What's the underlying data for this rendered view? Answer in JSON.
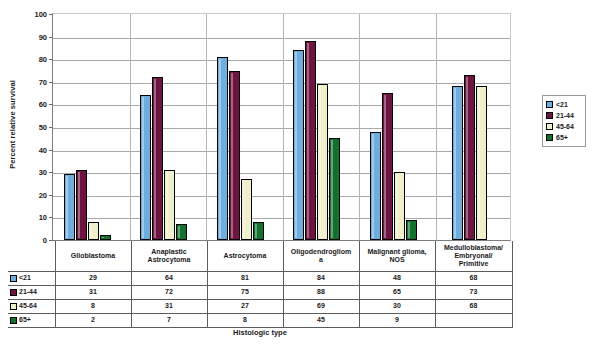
{
  "chart_data": {
    "type": "bar",
    "title": "",
    "xlabel": "Histologic type",
    "ylabel": "Percent relative survival",
    "ylim": [
      0,
      100
    ],
    "ytick_step": 10,
    "yticks": [
      0,
      10,
      20,
      30,
      40,
      50,
      60,
      70,
      80,
      90,
      100
    ],
    "grid": true,
    "legend_position": "right",
    "categories": [
      "Glioblastoma",
      "Anaplastic Astrocytoma",
      "Astrocytoma",
      "Oligodendroglioma",
      "Malignant glioma, NOS",
      "Medulloblastoma/ Embryonal/ Primitive"
    ],
    "category_display": [
      [
        "Glioblastoma"
      ],
      [
        "Anaplastic",
        "Astrocytoma"
      ],
      [
        "Astrocytoma"
      ],
      [
        "Oligodendrogliom",
        "a"
      ],
      [
        "Malignant glioma,",
        "NOS"
      ],
      [
        "Medulloblastoma/",
        "Embryonal/",
        "Primitive"
      ]
    ],
    "series": [
      {
        "name": "<21",
        "color": "#6FAEDC",
        "values": [
          29,
          64,
          81,
          84,
          48,
          68
        ]
      },
      {
        "name": "21-44",
        "color": "#6D1540",
        "values": [
          31,
          72,
          75,
          88,
          65,
          73
        ]
      },
      {
        "name": "45-64",
        "color": "#EFEFCB",
        "values": [
          8,
          31,
          27,
          69,
          30,
          68
        ]
      },
      {
        "name": "65+",
        "color": "#14702F",
        "values": [
          2,
          7,
          8,
          45,
          9,
          null
        ]
      }
    ]
  },
  "legend": {
    "items": [
      {
        "label": "<21",
        "color": "#6FAEDC"
      },
      {
        "label": "21-44",
        "color": "#6D1540"
      },
      {
        "label": "45-64",
        "color": "#EFEFCB"
      },
      {
        "label": "65+",
        "color": "#14702F"
      }
    ]
  },
  "table": {
    "column_headers": [
      "Glioblastoma",
      "Anaplastic Astrocytoma",
      "Astrocytoma",
      "Oligodendroglioma",
      "Malignant glioma, NOS",
      "Medulloblastoma/ Embryonal/ Primitive"
    ],
    "rows": [
      {
        "label": "<21",
        "color": "#6FAEDC",
        "cells": [
          "29",
          "64",
          "81",
          "84",
          "48",
          "68"
        ]
      },
      {
        "label": "21-44",
        "color": "#6D1540",
        "cells": [
          "31",
          "72",
          "75",
          "88",
          "65",
          "73"
        ]
      },
      {
        "label": "45-64",
        "color": "#EFEFCB",
        "cells": [
          "8",
          "31",
          "27",
          "69",
          "30",
          "68"
        ]
      },
      {
        "label": "65+",
        "color": "#14702F",
        "cells": [
          "2",
          "7",
          "8",
          "45",
          "9",
          ""
        ]
      }
    ]
  },
  "axes": {
    "y_title": "Percent relative survival",
    "x_title": "Histologic type"
  }
}
